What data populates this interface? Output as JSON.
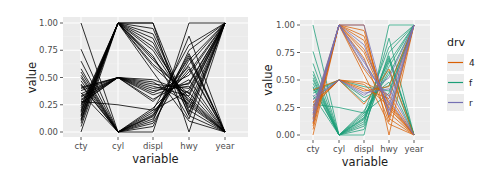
{
  "chart_data": [
    {
      "type": "line",
      "subtype": "parallel-coordinates",
      "title": "",
      "xlabel": "variable",
      "ylabel": "value",
      "categories": [
        "cty",
        "cyl",
        "displ",
        "hwy",
        "year"
      ],
      "yticks": [
        "0.00",
        "0.25",
        "0.50",
        "0.75",
        "1.00"
      ],
      "ylim": [
        0,
        1
      ],
      "grid": true,
      "legend": null,
      "line_color": "#000000",
      "series": [
        {
          "values": [
            1.0,
            0.0,
            0.0,
            1.0,
            1.0
          ]
        },
        {
          "values": [
            0.76,
            0.0,
            0.1,
            0.88,
            0.0
          ]
        },
        {
          "values": [
            0.65,
            0.0,
            0.05,
            0.75,
            1.0
          ]
        },
        {
          "values": [
            0.58,
            0.0,
            0.12,
            0.7,
            0.0
          ]
        },
        {
          "values": [
            0.52,
            0.0,
            0.15,
            0.62,
            1.0
          ]
        },
        {
          "values": [
            0.47,
            0.0,
            0.18,
            0.58,
            0.0
          ]
        },
        {
          "values": [
            0.43,
            0.0,
            0.22,
            0.55,
            1.0
          ]
        },
        {
          "values": [
            0.4,
            0.5,
            0.3,
            0.48,
            0.0
          ]
        },
        {
          "values": [
            0.38,
            0.5,
            0.34,
            0.45,
            1.0
          ]
        },
        {
          "values": [
            0.35,
            0.5,
            0.38,
            0.42,
            0.0
          ]
        },
        {
          "values": [
            0.33,
            0.5,
            0.44,
            0.4,
            1.0
          ]
        },
        {
          "values": [
            0.3,
            0.5,
            0.48,
            0.36,
            0.0
          ]
        },
        {
          "values": [
            0.28,
            0.25,
            0.2,
            0.38,
            1.0
          ]
        },
        {
          "values": [
            0.26,
            0.5,
            0.42,
            0.33,
            1.0
          ]
        },
        {
          "values": [
            0.22,
            1.0,
            0.6,
            0.3,
            0.0
          ]
        },
        {
          "values": [
            0.2,
            1.0,
            0.68,
            0.27,
            1.0
          ]
        },
        {
          "values": [
            0.18,
            1.0,
            0.75,
            0.24,
            0.0
          ]
        },
        {
          "values": [
            0.16,
            1.0,
            0.82,
            0.22,
            1.0
          ]
        },
        {
          "values": [
            0.14,
            1.0,
            0.9,
            0.2,
            0.0
          ]
        },
        {
          "values": [
            0.12,
            1.0,
            1.0,
            0.18,
            1.0
          ]
        },
        {
          "values": [
            0.1,
            1.0,
            0.95,
            0.15,
            0.0
          ]
        },
        {
          "values": [
            0.08,
            1.0,
            0.7,
            0.12,
            1.0
          ]
        },
        {
          "values": [
            0.05,
            1.0,
            0.55,
            0.1,
            0.0
          ]
        },
        {
          "values": [
            0.0,
            1.0,
            1.0,
            0.0,
            1.0
          ]
        },
        {
          "values": [
            0.36,
            0.0,
            0.08,
            0.66,
            1.0
          ]
        },
        {
          "values": [
            0.44,
            0.0,
            0.14,
            0.72,
            0.0
          ]
        },
        {
          "values": [
            0.5,
            0.0,
            0.2,
            0.8,
            1.0
          ]
        },
        {
          "values": [
            0.32,
            0.5,
            0.36,
            0.52,
            1.0
          ]
        },
        {
          "values": [
            0.24,
            1.0,
            0.62,
            0.35,
            1.0
          ]
        },
        {
          "values": [
            0.15,
            1.0,
            0.78,
            0.28,
            0.0
          ]
        },
        {
          "values": [
            0.41,
            0.5,
            0.28,
            0.6,
            0.0
          ]
        },
        {
          "values": [
            0.29,
            0.5,
            0.4,
            0.44,
            1.0
          ]
        },
        {
          "values": [
            0.19,
            1.0,
            0.66,
            0.32,
            0.0
          ]
        },
        {
          "values": [
            0.11,
            1.0,
            0.86,
            0.16,
            1.0
          ]
        },
        {
          "values": [
            0.55,
            0.0,
            0.16,
            0.68,
            0.0
          ]
        },
        {
          "values": [
            0.27,
            0.5,
            0.46,
            0.26,
            0.0
          ]
        }
      ]
    },
    {
      "type": "line",
      "subtype": "parallel-coordinates",
      "title": "",
      "xlabel": "variable",
      "ylabel": "value",
      "categories": [
        "cty",
        "cyl",
        "displ",
        "hwy",
        "year"
      ],
      "yticks": [
        "0.00",
        "0.25",
        "0.50",
        "0.75",
        "1.00"
      ],
      "ylim": [
        0,
        1
      ],
      "grid": true,
      "legend": {
        "title": "drv",
        "position": "right",
        "entries": [
          {
            "label": "4",
            "color": "#D95F02"
          },
          {
            "label": "f",
            "color": "#1B9E77"
          },
          {
            "label": "r",
            "color": "#7570B3"
          }
        ]
      },
      "series": [
        {
          "group": "f",
          "values": [
            1.0,
            0.0,
            0.0,
            1.0,
            1.0
          ]
        },
        {
          "group": "f",
          "values": [
            0.76,
            0.0,
            0.1,
            0.88,
            0.0
          ]
        },
        {
          "group": "f",
          "values": [
            0.65,
            0.0,
            0.05,
            0.75,
            1.0
          ]
        },
        {
          "group": "f",
          "values": [
            0.58,
            0.0,
            0.12,
            0.7,
            0.0
          ]
        },
        {
          "group": "f",
          "values": [
            0.52,
            0.0,
            0.15,
            0.62,
            1.0
          ]
        },
        {
          "group": "f",
          "values": [
            0.47,
            0.0,
            0.18,
            0.58,
            0.0
          ]
        },
        {
          "group": "f",
          "values": [
            0.43,
            0.0,
            0.22,
            0.55,
            1.0
          ]
        },
        {
          "group": "f",
          "values": [
            0.4,
            0.5,
            0.3,
            0.48,
            0.0
          ]
        },
        {
          "group": "f",
          "values": [
            0.38,
            0.5,
            0.34,
            0.45,
            1.0
          ]
        },
        {
          "group": "f",
          "values": [
            0.33,
            0.5,
            0.44,
            0.4,
            1.0
          ]
        },
        {
          "group": "f",
          "values": [
            0.36,
            0.0,
            0.08,
            0.66,
            1.0
          ]
        },
        {
          "group": "f",
          "values": [
            0.44,
            0.0,
            0.14,
            0.72,
            0.0
          ]
        },
        {
          "group": "f",
          "values": [
            0.5,
            0.0,
            0.2,
            0.8,
            1.0
          ]
        },
        {
          "group": "f",
          "values": [
            0.55,
            0.0,
            0.16,
            0.68,
            0.0
          ]
        },
        {
          "group": "f",
          "values": [
            0.28,
            0.25,
            0.2,
            0.38,
            1.0
          ]
        },
        {
          "group": "4",
          "values": [
            0.3,
            0.5,
            0.48,
            0.36,
            0.0
          ]
        },
        {
          "group": "4",
          "values": [
            0.26,
            0.5,
            0.42,
            0.33,
            1.0
          ]
        },
        {
          "group": "4",
          "values": [
            0.22,
            1.0,
            0.6,
            0.3,
            0.0
          ]
        },
        {
          "group": "4",
          "values": [
            0.18,
            1.0,
            0.75,
            0.24,
            0.0
          ]
        },
        {
          "group": "4",
          "values": [
            0.14,
            1.0,
            0.9,
            0.2,
            0.0
          ]
        },
        {
          "group": "4",
          "values": [
            0.1,
            1.0,
            0.95,
            0.15,
            0.0
          ]
        },
        {
          "group": "4",
          "values": [
            0.08,
            1.0,
            0.7,
            0.12,
            1.0
          ]
        },
        {
          "group": "4",
          "values": [
            0.05,
            1.0,
            0.55,
            0.1,
            0.0
          ]
        },
        {
          "group": "4",
          "values": [
            0.0,
            1.0,
            1.0,
            0.0,
            1.0
          ]
        },
        {
          "group": "4",
          "values": [
            0.15,
            1.0,
            0.78,
            0.28,
            0.0
          ]
        },
        {
          "group": "4",
          "values": [
            0.11,
            1.0,
            0.86,
            0.16,
            1.0
          ]
        },
        {
          "group": "4",
          "values": [
            0.27,
            0.5,
            0.46,
            0.26,
            0.0
          ]
        },
        {
          "group": "4",
          "values": [
            0.29,
            0.5,
            0.4,
            0.44,
            1.0
          ]
        },
        {
          "group": "4",
          "values": [
            0.41,
            0.5,
            0.28,
            0.6,
            0.0
          ]
        },
        {
          "group": "r",
          "values": [
            0.35,
            0.5,
            0.38,
            0.42,
            0.0
          ]
        },
        {
          "group": "r",
          "values": [
            0.2,
            1.0,
            0.68,
            0.27,
            1.0
          ]
        },
        {
          "group": "r",
          "values": [
            0.16,
            1.0,
            0.82,
            0.22,
            1.0
          ]
        },
        {
          "group": "r",
          "values": [
            0.12,
            1.0,
            1.0,
            0.18,
            1.0
          ]
        },
        {
          "group": "r",
          "values": [
            0.24,
            1.0,
            0.62,
            0.35,
            1.0
          ]
        },
        {
          "group": "r",
          "values": [
            0.19,
            1.0,
            0.66,
            0.32,
            0.0
          ]
        },
        {
          "group": "r",
          "values": [
            0.32,
            0.5,
            0.36,
            0.52,
            1.0
          ]
        }
      ]
    }
  ],
  "layout": {
    "panels": [
      {
        "x": 63,
        "y": 17,
        "w": 185,
        "h": 120,
        "y_top": 23,
        "y_bottom": 132,
        "x_positions": [
          81,
          118,
          153,
          189,
          225
        ]
      },
      {
        "x": 300,
        "y": 20,
        "w": 130,
        "h": 120,
        "y_top": 25,
        "y_bottom": 135,
        "x_positions": [
          313,
          339,
          364,
          389,
          414
        ]
      }
    ],
    "legend": {
      "x": 447,
      "y": 58
    },
    "panel_bg": "#EBEBEB",
    "grid_major": "#FFFFFF",
    "grid_minor": "#F5F5F5"
  }
}
